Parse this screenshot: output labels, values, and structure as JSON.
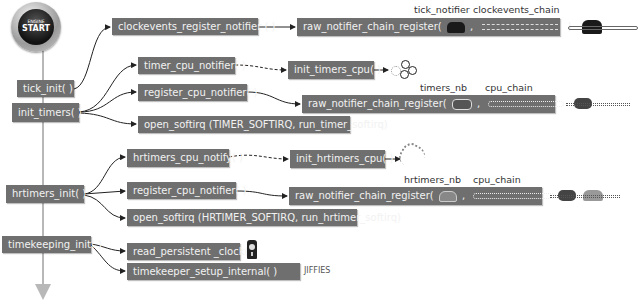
{
  "diagram": {
    "start_button": {
      "top_text": "ENGINE",
      "main_text": "START"
    },
    "left_column": [
      {
        "id": "tick_init",
        "label": "tick_init( )"
      },
      {
        "id": "init_timers",
        "label": "init_timers( )"
      },
      {
        "id": "hrtimers_init",
        "label": "hrtimers_init( )"
      },
      {
        "id": "timekeeping_init",
        "label": "timekeeping_init( )"
      }
    ],
    "tick_init_branch": {
      "call": "clockevents_register_notifier ( )",
      "register": "raw_notifier_chain_register(",
      "register_sep": ",",
      "register_close": ")",
      "arg1_label": "tick_notifier",
      "arg2_label": "clockevents_chain"
    },
    "init_timers_branch": {
      "cpu_notifier": "timer_cpu_notifier( )",
      "cpu_init": "init_timers_cpu( )",
      "register_cpu": "register_cpu_notifier( )",
      "register": "raw_notifier_chain_register(",
      "register_sep": ",",
      "register_close": ")",
      "arg1_label": "timers_nb",
      "arg2_label": "cpu_chain",
      "softirq": "open_softirq (TIMER_SOFTIRQ, run_timer_softirq)"
    },
    "hrtimers_branch": {
      "cpu_notify": "hrtimers_cpu_notify( )",
      "cpu_init": "init_hrtimers_cpu( )",
      "register_cpu": "register_cpu_notifier( )",
      "register": "raw_notifier_chain_register(",
      "register_sep": ",",
      "register_close": ")",
      "arg1_label": "hrtimers_nb",
      "arg2_label": "cpu_chain",
      "softirq": "open_softirq (HRTIMER_SOFTIRQ, run_hrtimer_softirq)"
    },
    "timekeeping_branch": {
      "read_clock": "read_persistent _clock( )",
      "setup": "timekeeper_setup_internal( )",
      "setup_note": "JIFFIES"
    },
    "icons": [
      "telephone-icon",
      "chain-icon",
      "gears-icon",
      "clock-icon"
    ],
    "colors": {
      "box_bg": "#6f6f6f",
      "box_text": "#f2f2f2",
      "timeline": "#b8b8b8",
      "arrow": "#333333"
    }
  }
}
